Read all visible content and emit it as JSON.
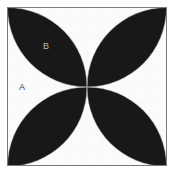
{
  "figure": {
    "canvas": {
      "width": 174,
      "height": 176
    },
    "frame": {
      "x": 7,
      "y": 7,
      "width": 160,
      "height": 159,
      "stroke_color": "#7a7a7a",
      "stroke_width": 1,
      "fill_color": "#f2f2f2"
    },
    "background_color": "#ffffff",
    "petal_color": "#191919",
    "gap_color": "#fcfcfc",
    "labels": [
      {
        "id": "A",
        "text": "A",
        "x": 22,
        "y": 88,
        "color": "#3b3b3b",
        "region": "white-cusp-region-left"
      },
      {
        "id": "B",
        "text": "B",
        "x": 46,
        "y": 47,
        "color": "#b9b9b9",
        "region": "black-petal-upper-left"
      }
    ],
    "geometry": {
      "description": "Square with four circular arcs of radius equal to half the side, centred on the midpoints of the square's sides. The arcs bound four black lens-shaped petals pointing to the corners, leaving white cusp regions at each edge midpoint and at the centre.",
      "arc_radius": 80,
      "petal_count": 4,
      "petal_orientation": "corners"
    }
  }
}
